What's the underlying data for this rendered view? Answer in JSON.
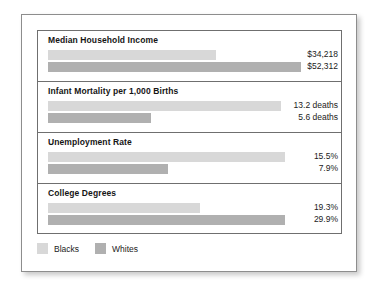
{
  "chart_data": {
    "type": "bar",
    "title": "",
    "orientation": "horizontal",
    "grid": false,
    "legend_position": "bottom-left",
    "categories": [
      "Median Household Income",
      "Infant Mortality per 1,000 Births",
      "Unemployment Rate",
      "College Degrees"
    ],
    "series": [
      {
        "name": "Blacks",
        "color": "#d8d8d8",
        "values": [
          34218,
          13.2,
          15.5,
          19.3
        ],
        "labels": [
          "$34,218",
          "13.2 deaths",
          "15.5%",
          "19.3%"
        ]
      },
      {
        "name": "Whites",
        "color": "#b0b0b0",
        "values": [
          52312,
          5.6,
          7.9,
          29.9
        ],
        "labels": [
          "$52,312",
          "5.6 deaths",
          "7.9%",
          "29.9%"
        ]
      }
    ],
    "groups": [
      {
        "title": "Median Household Income",
        "bars": [
          {
            "series": "Blacks",
            "label": "$34,218",
            "width_px": 168
          },
          {
            "series": "Whites",
            "label": "$52,312",
            "width_px": 253
          }
        ]
      },
      {
        "title": "Infant Mortality per 1,000 Births",
        "bars": [
          {
            "series": "Blacks",
            "label": "13.2 deaths",
            "width_px": 233
          },
          {
            "series": "Whites",
            "label": "5.6 deaths",
            "width_px": 103
          }
        ]
      },
      {
        "title": "Unemployment Rate",
        "bars": [
          {
            "series": "Blacks",
            "label": "15.5%",
            "width_px": 237
          },
          {
            "series": "Whites",
            "label": "7.9%",
            "width_px": 120
          }
        ]
      },
      {
        "title": "College Degrees",
        "bars": [
          {
            "series": "Blacks",
            "label": "19.3%",
            "width_px": 152
          },
          {
            "series": "Whites",
            "label": "29.9%",
            "width_px": 237
          }
        ]
      }
    ]
  },
  "legend": {
    "items": [
      {
        "label": "Blacks",
        "color": "#d8d8d8"
      },
      {
        "label": "Whites",
        "color": "#b0b0b0"
      }
    ]
  }
}
